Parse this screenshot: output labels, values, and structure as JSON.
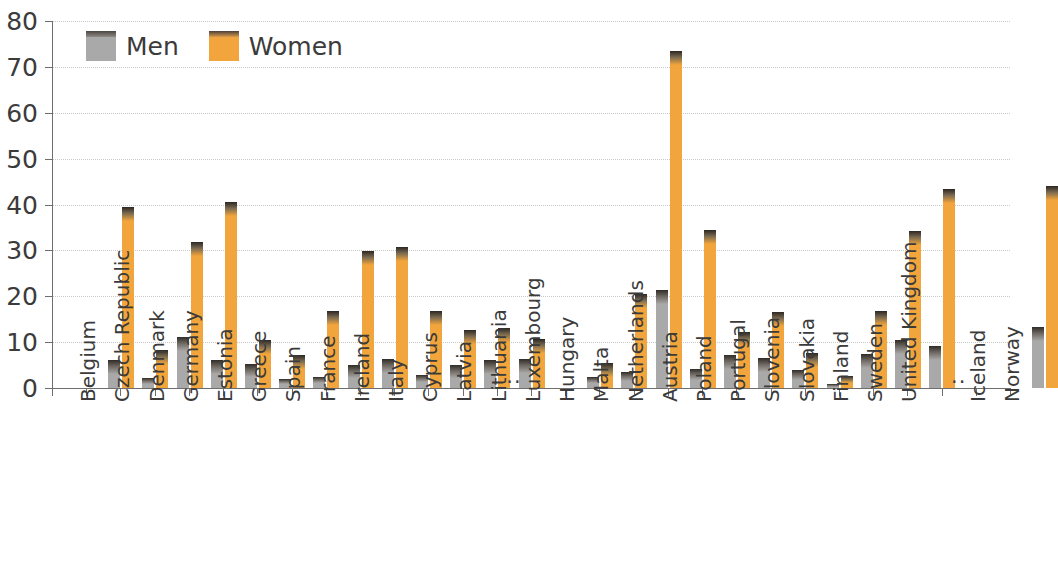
{
  "chart_data": {
    "type": "bar",
    "title": "",
    "xlabel": "",
    "ylabel": "",
    "ylim": [
      0,
      80
    ],
    "yticks": [
      0,
      10,
      20,
      30,
      40,
      50,
      60,
      70,
      80
    ],
    "grid": true,
    "legend_position": "top-left",
    "no_data_marker": "..",
    "colors": {
      "men": "#a9a9a9",
      "women": "#f2a53c",
      "text": "#3b3b3b",
      "grid": "#c9c9c9"
    },
    "categories": [
      "Belgium",
      "Czech Republic",
      "Denmark",
      "Germany",
      "Estonia",
      "Greece",
      "Spain",
      "France",
      "Ireland",
      "Italy",
      "Cyprus",
      "Latvia",
      "Lithuania",
      "Luxembourg",
      "Hungary",
      "Malta",
      "Netherlands",
      "Austria",
      "Poland",
      "Portugal",
      "Slovenia",
      "Slovakia",
      "Finland",
      "Sweden",
      "United Kingdom",
      "Iceland",
      "Norway"
    ],
    "series": [
      {
        "name": "Men",
        "values": [
          6.2,
          2.1,
          11.2,
          6.0,
          5.3,
          1.9,
          2.3,
          5.0,
          6.3,
          2.8,
          5.0,
          6.0,
          6.4,
          null,
          2.3,
          3.6,
          21.4,
          4.1,
          7.1,
          6.6,
          4.0,
          0.8,
          7.5,
          10.4,
          9.2,
          null,
          13.3
        ]
      },
      {
        "name": "Women",
        "values": [
          39.5,
          8.2,
          31.8,
          40.5,
          10.4,
          7.2,
          16.8,
          29.9,
          30.7,
          16.8,
          12.6,
          13.1,
          10.7,
          null,
          5.5,
          20.6,
          73.5,
          34.5,
          12.3,
          16.5,
          7.6,
          2.6,
          16.8,
          34.3,
          43.4,
          null,
          44.0
        ]
      }
    ]
  },
  "legend": {
    "items": [
      {
        "label": "Men",
        "key": "men"
      },
      {
        "label": "Women",
        "key": "women"
      }
    ]
  }
}
